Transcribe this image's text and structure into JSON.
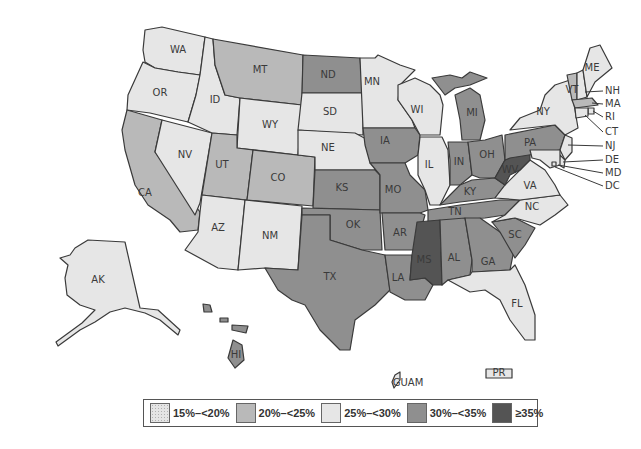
{
  "title": "",
  "colors": {
    "c15_20": "#e4e4e4",
    "c20_25": "#b9b9b9",
    "c25_30": "#e6e6e6",
    "c30_35": "#8f8f8f",
    "c35_plus": "#545454",
    "border": "#3a3a3a"
  },
  "legend": [
    {
      "label": "15%–<20%",
      "key": "c15_20",
      "pattern": "dotted"
    },
    {
      "label": "20%–<25%",
      "key": "c20_25",
      "pattern": "solid"
    },
    {
      "label": "25%–<30%",
      "key": "c25_30",
      "pattern": "solid"
    },
    {
      "label": "30%–<35%",
      "key": "c30_35",
      "pattern": "solid"
    },
    {
      "label": "≥35%",
      "key": "c35_plus",
      "pattern": "solid"
    }
  ],
  "states": {
    "WA": "25%–<30%",
    "OR": "25%–<30%",
    "ID": "25%–<30%",
    "NV": "25%–<30%",
    "CA": "20%–<25%",
    "MT": "20%–<25%",
    "WY": "25%–<30%",
    "UT": "20%–<25%",
    "CO": "20%–<25%",
    "AZ": "25%–<30%",
    "NM": "25%–<30%",
    "ND": "30%–<35%",
    "SD": "25%–<30%",
    "NE": "25%–<30%",
    "KS": "30%–<35%",
    "OK": "30%–<35%",
    "TX": "30%–<35%",
    "MN": "25%–<30%",
    "IA": "30%–<35%",
    "MO": "30%–<35%",
    "AR": "30%–<35%",
    "LA": "30%–<35%",
    "WI": "25%–<30%",
    "IL": "25%–<30%",
    "MI": "30%–<35%",
    "IN": "30%–<35%",
    "OH": "30%–<35%",
    "KY": "30%–<35%",
    "TN": "30%–<35%",
    "MS": "≥35%",
    "AL": "30%–<35%",
    "GA": "30%–<35%",
    "FL": "25%–<30%",
    "SC": "30%–<35%",
    "NC": "25%–<30%",
    "VA": "25%–<30%",
    "WV": "≥35%",
    "PA": "30%–<35%",
    "NY": "25%–<30%",
    "VT": "20%–<25%",
    "NH": "25%–<30%",
    "ME": "25%–<30%",
    "MA": "20%–<25%",
    "RI": "25%–<30%",
    "CT": "25%–<30%",
    "NJ": "25%–<30%",
    "DE": "25%–<30%",
    "MD": "25%–<30%",
    "DC": "25%–<30%",
    "AK": "25%–<30%",
    "HI": "30%–<35%",
    "GUAM": "25%–<30%",
    "PR": "25%–<30%"
  },
  "labels": {
    "WA": "WA",
    "OR": "OR",
    "ID": "ID",
    "NV": "NV",
    "CA": "CA",
    "MT": "MT",
    "WY": "WY",
    "UT": "UT",
    "CO": "CO",
    "AZ": "AZ",
    "NM": "NM",
    "ND": "ND",
    "SD": "SD",
    "NE": "NE",
    "KS": "KS",
    "OK": "OK",
    "TX": "TX",
    "MN": "MN",
    "IA": "IA",
    "MO": "MO",
    "AR": "AR",
    "LA": "LA",
    "WI": "WI",
    "IL": "IL",
    "MI": "MI",
    "IN": "IN",
    "OH": "OH",
    "KY": "KY",
    "TN": "TN",
    "MS": "MS",
    "AL": "AL",
    "GA": "GA",
    "FL": "FL",
    "SC": "SC",
    "NC": "NC",
    "VA": "VA",
    "WV": "WV",
    "PA": "PA",
    "NY": "NY",
    "VT": "VT",
    "ME": "ME",
    "AK": "AK",
    "HI": "HI",
    "GUAM": "GUAM",
    "PR": "PR",
    "NH": "NH",
    "MA": "MA",
    "RI": "RI",
    "CT": "CT",
    "NJ": "NJ",
    "DE": "DE",
    "MD": "MD",
    "DC": "DC"
  }
}
